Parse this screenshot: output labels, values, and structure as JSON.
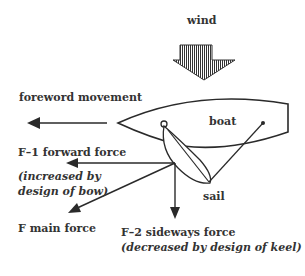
{
  "diagram": {
    "labels": {
      "wind": "wind",
      "forward_movement": "foreword movement",
      "boat": "boat",
      "sail": "sail",
      "f1": "F–1  forward force",
      "f1_note_line1": "(increased by",
      "f1_note_line2": "design of bow)",
      "f_main": "F  main force",
      "f2": "F–2  sideways force",
      "f2_note": "(decreased by design of keel)"
    },
    "icons": [
      "wind-arrow-icon",
      "arrow-left-icon",
      "arrow-down-icon"
    ],
    "colors": {
      "line": "#2a2a2a",
      "background": "#ffffff"
    }
  }
}
